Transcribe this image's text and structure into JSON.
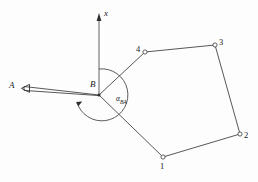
{
  "figure": {
    "kind": "survey-traverse-diagram",
    "background_color": "#fdfdfd",
    "line_color": "#3a3a3a",
    "label_color": "#1a1a1a",
    "axis": {
      "name": "x-axis",
      "label": "x",
      "direction": "up",
      "arrow": "arrowhead-up",
      "origin_label": "B",
      "x": 99,
      "y_top": 14,
      "y_bottom": 95
    },
    "stations": [
      {
        "id": "A",
        "label": "A",
        "x": 16,
        "y": 88,
        "marker": "arrowhead-left"
      },
      {
        "id": "B",
        "label": "B",
        "x": 99,
        "y": 95,
        "marker": "station-point"
      }
    ],
    "backsight": {
      "name": "backsight-line-BA",
      "from": "B",
      "to": "A",
      "style": "double-line-ribbon",
      "arrow_at": "A"
    },
    "angle": {
      "name": "azimuth-angle-BA",
      "label": "α",
      "subscript": "BA",
      "label_x": 116,
      "label_y": 99,
      "arc_radius": 26,
      "arc_center": {
        "x": 99,
        "y": 95
      },
      "start": "x-axis-up",
      "end": "direction-BA",
      "sweep": "clockwise"
    },
    "polygon": {
      "name": "traverse-polygon",
      "closed": false,
      "vertices": [
        {
          "label": "1",
          "x": 163,
          "y": 157,
          "marker": "open-circle",
          "label_dx": -2,
          "label_dy": 12
        },
        {
          "label": "2",
          "x": 240,
          "y": 134,
          "marker": "open-circle",
          "label_dx": 4,
          "label_dy": 4
        },
        {
          "label": "3",
          "x": 215,
          "y": 45,
          "marker": "open-circle",
          "label_dx": 4,
          "label_dy": -2
        },
        {
          "label": "4",
          "x": 145,
          "y": 52,
          "marker": "open-circle",
          "label_dx": -9,
          "label_dy": -2
        }
      ],
      "edges": [
        {
          "from": "B",
          "to": "1"
        },
        {
          "from": "1",
          "to": "2"
        },
        {
          "from": "2",
          "to": "3"
        },
        {
          "from": "3",
          "to": "4"
        },
        {
          "from": "4",
          "to": "B"
        }
      ]
    }
  }
}
